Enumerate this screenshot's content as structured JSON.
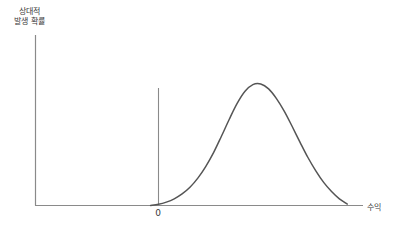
{
  "figure": {
    "title": "",
    "background_color": "#ffffff",
    "axis_color": "#8a8a8a",
    "curve_color": "#555555",
    "marker_line_color": "#8a8a8a",
    "text_color": "#3a3a3a"
  },
  "labels": {
    "y_axis_line1": "상대적",
    "y_axis_line2": "발생 확률",
    "x_axis": "수익",
    "zero_tick": "0"
  },
  "chart_data": {
    "type": "line",
    "title": "",
    "xlabel": "수익",
    "ylabel": "상대적 발생 확률",
    "grid": false,
    "legend": null,
    "annotations": [
      {
        "name": "zero-marker",
        "label": "0",
        "x": 0,
        "type": "vertical-line",
        "y_top": 0.72
      }
    ],
    "xlim": [
      -1.05,
      2.6
    ],
    "ylim": [
      0,
      1.12
    ],
    "x_tick_labels": [
      "0"
    ],
    "y_tick_labels": [],
    "series": [
      {
        "name": "distribution",
        "description": "bell-shaped relative frequency curve peaking at positive return",
        "x": [
          -0.1,
          0.0,
          0.1,
          0.2,
          0.3,
          0.4,
          0.5,
          0.6,
          0.7,
          0.8,
          0.9,
          1.0,
          1.1,
          1.2,
          1.3,
          1.4,
          1.5,
          1.6,
          1.7,
          1.8,
          1.9,
          2.0,
          2.1,
          2.2,
          2.3,
          2.4
        ],
        "y": [
          0.0,
          0.01,
          0.028,
          0.055,
          0.095,
          0.15,
          0.225,
          0.32,
          0.435,
          0.57,
          0.71,
          0.84,
          0.94,
          0.995,
          1.0,
          0.96,
          0.88,
          0.775,
          0.65,
          0.52,
          0.395,
          0.285,
          0.19,
          0.115,
          0.055,
          0.012
        ]
      }
    ]
  }
}
